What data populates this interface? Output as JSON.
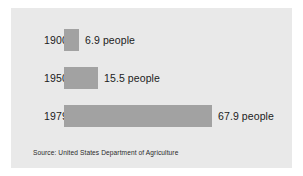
{
  "chart_data": {
    "type": "bar",
    "orientation": "horizontal",
    "title": "",
    "xlabel": "",
    "ylabel": "",
    "categories": [
      "1900",
      "1950",
      "1979"
    ],
    "values": [
      6.9,
      15.5,
      67.9
    ],
    "value_labels": [
      "6.9 people",
      "15.5 people",
      "67.9 people"
    ],
    "unit": "people",
    "xlim": [
      0,
      67.9
    ],
    "grid": false,
    "legend": null,
    "bar_color": "#a2a2a2",
    "panel_color": "#e9e9e9",
    "text_color": "#1c1c1c",
    "source": "Source: United States Department of Agriculture"
  },
  "rows": [
    {
      "year": "1900",
      "label": "6.9 people",
      "value": 6.9
    },
    {
      "year": "1950",
      "label": "15.5 people",
      "value": 15.5
    },
    {
      "year": "1979",
      "label": "67.9 people",
      "value": 67.9
    }
  ],
  "footer": {
    "source": "Source: United States Department of Agriculture"
  }
}
